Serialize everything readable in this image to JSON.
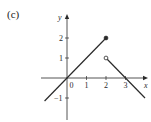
{
  "panel_label": "(c)",
  "chart_data": {
    "type": "line",
    "title": "",
    "xlabel": "x",
    "ylabel": "y",
    "xlim": [
      -1.2,
      4.1
    ],
    "ylim": [
      -2.1,
      3.2
    ],
    "x_ticks": [
      0,
      1,
      2,
      3
    ],
    "y_ticks": [
      -1,
      1,
      2
    ],
    "x_tick_labels": [
      "0",
      "1",
      "2",
      "3"
    ],
    "y_tick_labels": [
      "-1",
      "1",
      "2"
    ],
    "grid": false,
    "series": [
      {
        "name": "segment-1",
        "points": [
          [
            -1.15,
            -1.15
          ],
          [
            2,
            2
          ]
        ],
        "end_marker": {
          "x": 2,
          "y": 2,
          "style": "filled"
        }
      },
      {
        "name": "segment-2",
        "points": [
          [
            2,
            1
          ],
          [
            4,
            -1
          ]
        ],
        "start_marker": {
          "x": 2,
          "y": 1,
          "style": "open"
        }
      }
    ],
    "annotations": [
      "piecewise function with jump discontinuity at x = 2"
    ]
  }
}
